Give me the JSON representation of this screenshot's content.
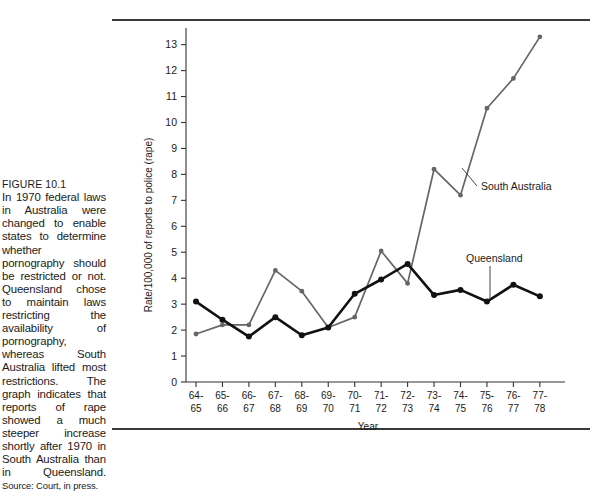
{
  "figure": {
    "label": "FIGURE 10.1",
    "caption": "In 1970 federal laws in Australia were changed to enable states to determine whether pornography should be restricted or not. Queensland chose to maintain laws restricting the availability of pornography, whereas South Australia lifted most restrictions. The graph indicates that reports of rape showed a much steeper increase shortly after 1970 in South Australia than in Queensland.",
    "source": "Source: Court, in press."
  },
  "chart_data": {
    "type": "line",
    "title": "",
    "xlabel": "Year",
    "ylabel": "Rate/100,000 of reports to police (rape)",
    "categories": [
      "64-65",
      "65-66",
      "66-67",
      "67-68",
      "68-69",
      "69-70",
      "70-71",
      "71-72",
      "72-73",
      "73-74",
      "74-75",
      "75-76",
      "76-77",
      "77-78"
    ],
    "xtick_top": [
      "64-",
      "65-",
      "66-",
      "67-",
      "68-",
      "69-",
      "70-",
      "71-",
      "72-",
      "73-",
      "74-",
      "75-",
      "76-",
      "77-"
    ],
    "xtick_bottom": [
      "65",
      "66",
      "67",
      "68",
      "69",
      "70",
      "71",
      "72",
      "73",
      "74",
      "75",
      "76",
      "77",
      "78"
    ],
    "ylim": [
      0,
      13.6
    ],
    "yticks": [
      0,
      1,
      2,
      3,
      4,
      5,
      6,
      7,
      8,
      9,
      10,
      11,
      12,
      13
    ],
    "grid": false,
    "legend_position": "inline-annotations",
    "series": [
      {
        "name": "Queensland",
        "color": "#111111",
        "values": [
          3.1,
          2.4,
          1.75,
          2.5,
          1.8,
          2.1,
          3.4,
          3.95,
          4.55,
          3.35,
          3.55,
          3.1,
          3.75,
          3.3
        ]
      },
      {
        "name": "South Australia",
        "color": "#666666",
        "values": [
          1.85,
          2.2,
          2.2,
          4.3,
          3.5,
          2.1,
          2.5,
          5.05,
          3.8,
          8.2,
          7.2,
          10.55,
          11.7,
          13.3
        ]
      }
    ],
    "annotations": [
      {
        "text": "South Australia",
        "series": "South Australia"
      },
      {
        "text": "Queensland",
        "series": "Queensland"
      }
    ]
  }
}
